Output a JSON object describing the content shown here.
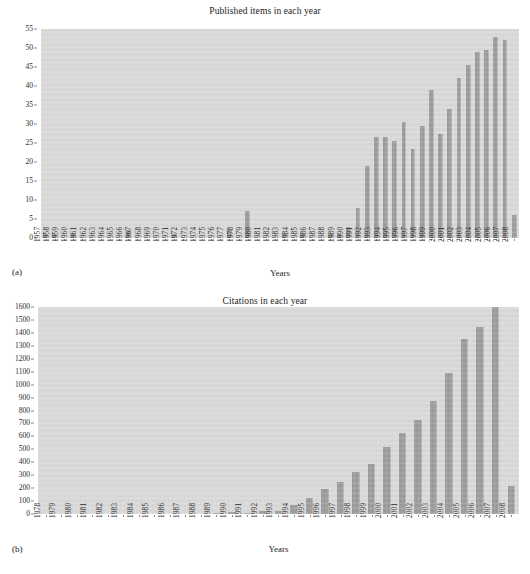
{
  "figure": {
    "panels": [
      {
        "tag": "(a)",
        "title": "Published items in each year",
        "xlabel": "Years"
      },
      {
        "tag": "(b)",
        "title": "Citations in each year",
        "xlabel": "Years"
      }
    ]
  },
  "colors": {
    "bar": "#9b9b9b",
    "plot_background": "#d9d9d9",
    "page_background": "#ffffff",
    "text": "#232323"
  },
  "chart_data": [
    {
      "type": "bar",
      "title": "Published items in each year",
      "xlabel": "Years",
      "ylabel": "",
      "ylim": [
        0,
        55
      ],
      "yticks": [
        0,
        5,
        10,
        15,
        20,
        25,
        30,
        35,
        40,
        45,
        50,
        55
      ],
      "grid": false,
      "legend": "none",
      "panel": "(a)",
      "categories": [
        "1957",
        "1958",
        "1959",
        "1960",
        "1961",
        "1962",
        "1963",
        "1964",
        "1965",
        "1966",
        "1967",
        "1968",
        "1969",
        "1970",
        "1971",
        "1972",
        "1973",
        "1974",
        "1975",
        "1976",
        "1977",
        "1978",
        "1979",
        "1980",
        "1981",
        "1982",
        "1983",
        "1984",
        "1985",
        "1986",
        "1987",
        "1988",
        "1989",
        "1990",
        "1991",
        "1992",
        "1993",
        "1994",
        "1995",
        "1996",
        "1997",
        "1998",
        "1999",
        "2000",
        "2001",
        "2002",
        "2003",
        "2004",
        "2005",
        "2006",
        "2007",
        "2008"
      ],
      "values": [
        1,
        1,
        0,
        1,
        0,
        0,
        0,
        0,
        0,
        2,
        0,
        0,
        0,
        0,
        1,
        0,
        0,
        0,
        0,
        0,
        2,
        0,
        7,
        0,
        0,
        0,
        1,
        0,
        1,
        0,
        0,
        1,
        1,
        3,
        8,
        19,
        26.5,
        26.5,
        25.5,
        30.5,
        23.5,
        29.5,
        39,
        27.5,
        34,
        42,
        45.5,
        49,
        49.5,
        53,
        52,
        6
      ]
    },
    {
      "type": "bar",
      "title": "Citations in each year",
      "xlabel": "Years",
      "ylabel": "",
      "ylim": [
        0,
        1600
      ],
      "yticks": [
        0,
        100,
        200,
        300,
        400,
        500,
        600,
        700,
        800,
        900,
        1000,
        1100,
        1200,
        1300,
        1400,
        1500,
        1600
      ],
      "grid": false,
      "legend": "none",
      "panel": "(b)",
      "categories": [
        "1978",
        "1979",
        "1980",
        "1981",
        "1982",
        "1983",
        "1984",
        "1985",
        "1986",
        "1987",
        "1988",
        "1989",
        "1990",
        "1991",
        "1992",
        "1993",
        "1994",
        "1995",
        "1996",
        "1997",
        "1998",
        "1999",
        "2000",
        "2001",
        "2002",
        "2003",
        "2004",
        "2005",
        "2006",
        "2007",
        "2008"
      ],
      "values": [
        0,
        0,
        0,
        0,
        0,
        0,
        0,
        0,
        0,
        0,
        0,
        8,
        12,
        10,
        25,
        22,
        70,
        120,
        190,
        245,
        325,
        390,
        515,
        625,
        730,
        870,
        1090,
        1355,
        1445,
        1610,
        220
      ]
    }
  ]
}
